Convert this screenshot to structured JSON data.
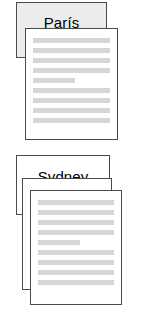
{
  "figure": {
    "type": "document-cluster-illustration",
    "background_color": "#ffffff",
    "ink_color": "#4a4a4a",
    "text_line_color": "#d6d6d6",
    "shaded_card_color": "#ececec"
  },
  "clusters": [
    {
      "id": "paris",
      "label": "París",
      "label_card": {
        "shaded": true
      },
      "pages": [
        {
          "id": "paris-front-page",
          "has_text": true,
          "lines": [
            {
              "width": "full"
            },
            {
              "width": "full"
            },
            {
              "width": "full"
            },
            {
              "width": "full"
            },
            {
              "width": "short"
            },
            {
              "width": "full"
            },
            {
              "width": "full"
            },
            {
              "width": "full"
            },
            {
              "width": "full"
            }
          ]
        }
      ]
    },
    {
      "id": "sydney",
      "label": "Sydney",
      "label_card": {
        "shaded": false
      },
      "pages": [
        {
          "id": "sydney-middle-page",
          "has_text": false,
          "lines": []
        },
        {
          "id": "sydney-front-page",
          "has_text": true,
          "lines": [
            {
              "width": "full"
            },
            {
              "width": "full"
            },
            {
              "width": "full"
            },
            {
              "width": "full"
            },
            {
              "width": "short"
            },
            {
              "width": "full"
            },
            {
              "width": "full"
            },
            {
              "width": "full"
            },
            {
              "width": "full"
            }
          ]
        }
      ]
    }
  ]
}
